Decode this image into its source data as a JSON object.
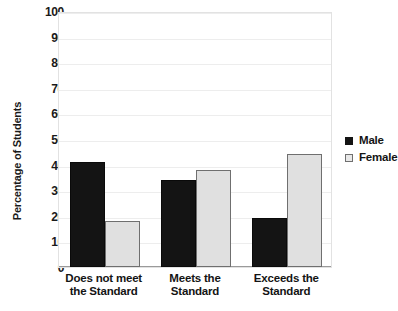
{
  "chart_data": {
    "type": "bar",
    "title": "",
    "xlabel": "",
    "ylabel": "Percentage of Students",
    "categories": [
      "Does not meet the Standard",
      "Meets the Standard",
      "Exceeds the Standard"
    ],
    "category_lines": [
      [
        "Does not meet",
        "the Standard"
      ],
      [
        "Meets the",
        "Standard"
      ],
      [
        "Exceeds the",
        "Standard"
      ]
    ],
    "series": [
      {
        "name": "Male",
        "values": [
          41,
          34,
          19
        ],
        "color": "#141414"
      },
      {
        "name": "Female",
        "values": [
          18,
          38,
          44
        ],
        "color": "#e0e0e0"
      }
    ],
    "ylim": [
      0,
      100
    ],
    "yticks": [
      0,
      10,
      20,
      30,
      40,
      50,
      60,
      70,
      80,
      90,
      100
    ],
    "ytick_labels": [
      "0",
      "10",
      "20",
      "30",
      "40",
      "50",
      "60",
      "70",
      "80",
      "90",
      "100"
    ],
    "grid": true,
    "grid_axis": "y",
    "legend_position": "right",
    "legend": [
      {
        "label": "Male",
        "swatch": "filled-square-black"
      },
      {
        "label": "Female",
        "swatch": "outlined-square-light"
      }
    ],
    "colors": {
      "male": "#141414",
      "female": "#e0e0e0",
      "gridline": "#ededed",
      "axis": "#9a9a9a",
      "text": "#141414",
      "background": "#ffffff"
    }
  }
}
